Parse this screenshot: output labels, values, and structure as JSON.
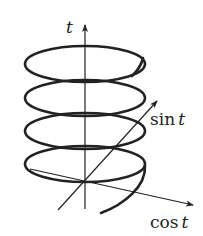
{
  "diagram": {
    "type": "3d-helix",
    "axes": {
      "vertical": {
        "label_fn": "",
        "label_var": "t"
      },
      "depth": {
        "label_fn": "sin",
        "label_var": "t"
      },
      "horizontal": {
        "label_fn": "cos",
        "label_var": "t"
      }
    },
    "coil_count": 4,
    "stroke_color": "#222222",
    "background": "#ffffff"
  }
}
